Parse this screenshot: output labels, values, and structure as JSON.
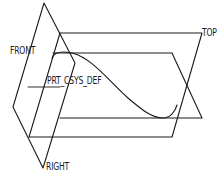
{
  "diagram": {
    "type": "cad-datum-planes",
    "colors": {
      "background": "#ffffff",
      "stroke": "#1a1a1a"
    },
    "labels": {
      "front": "FRONT",
      "top": "TOP",
      "right": "RIGHT",
      "csys": "PRT_CSYS_DEF"
    },
    "planes": [
      {
        "name": "RIGHT",
        "points": [
          [
            44,
            3
          ],
          [
            75,
            63
          ],
          [
            43,
            168
          ],
          [
            13,
            107
          ]
        ]
      },
      {
        "name": "FRONT",
        "points": [
          [
            60,
            33
          ],
          [
            202,
            33
          ],
          [
            172,
            137
          ],
          [
            29,
            137
          ]
        ]
      },
      {
        "name": "TOP",
        "points": [
          [
            53,
            53
          ],
          [
            172,
            53
          ],
          [
            202,
            118
          ],
          [
            60,
            118
          ]
        ]
      }
    ],
    "csys": {
      "name": "PRT_CSYS_DEF",
      "origin": [
        44,
        87
      ]
    },
    "curve": {
      "type": "spline",
      "from": [
        52,
        58
      ],
      "to": [
        177,
        105
      ]
    }
  }
}
